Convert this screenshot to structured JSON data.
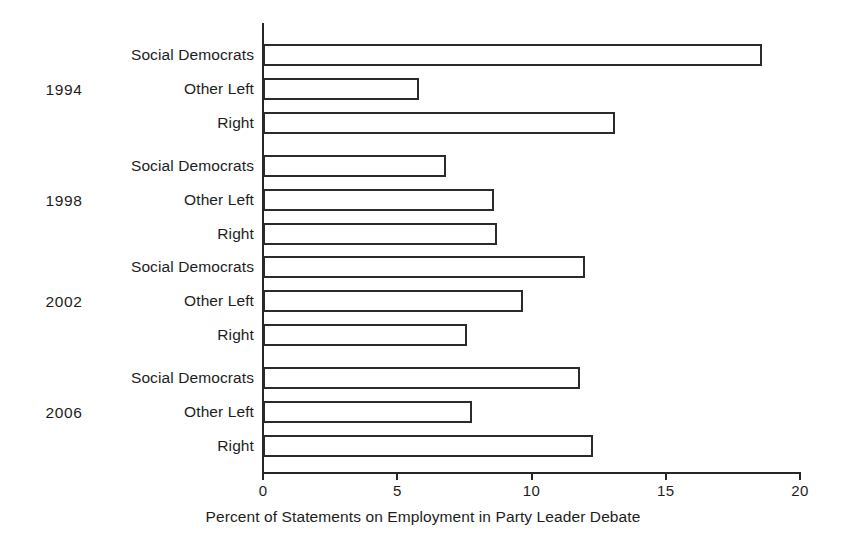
{
  "chart_data": {
    "type": "bar",
    "orientation": "horizontal",
    "title": "",
    "xlabel": "Percent of Statements on Employment in Party Leader Debate",
    "ylabel": "",
    "xlim": [
      0,
      20
    ],
    "xticks": [
      0,
      5,
      10,
      15,
      20
    ],
    "xtick_labels": [
      "0",
      "5",
      "10",
      "15",
      "20"
    ],
    "grid": false,
    "legend": null,
    "group_label_name": "year",
    "category_label_name": "party bloc",
    "categories": [
      "Social Democrats",
      "Other Left",
      "Right"
    ],
    "groups": [
      {
        "label": "1994",
        "bars": [
          {
            "category": "Social Democrats",
            "value": 18.6
          },
          {
            "category": "Other Left",
            "value": 5.8
          },
          {
            "category": "Right",
            "value": 13.1
          }
        ]
      },
      {
        "label": "1998",
        "bars": [
          {
            "category": "Social Democrats",
            "value": 6.8
          },
          {
            "category": "Other Left",
            "value": 8.6
          },
          {
            "category": "Right",
            "value": 8.7
          }
        ]
      },
      {
        "label": "2002",
        "bars": [
          {
            "category": "Social Democrats",
            "value": 12.0
          },
          {
            "category": "Other Left",
            "value": 9.7
          },
          {
            "category": "Right",
            "value": 7.6
          }
        ]
      },
      {
        "label": "2006",
        "bars": [
          {
            "category": "Social Democrats",
            "value": 11.8
          },
          {
            "category": "Other Left",
            "value": 7.8
          },
          {
            "category": "Right",
            "value": 12.3
          }
        ]
      }
    ],
    "colors": {
      "bar_fill": "#ffffff",
      "bar_stroke": "#2b2b2b",
      "axis": "#262626",
      "text": "#1d1d1d",
      "background": "#ffffff"
    }
  }
}
